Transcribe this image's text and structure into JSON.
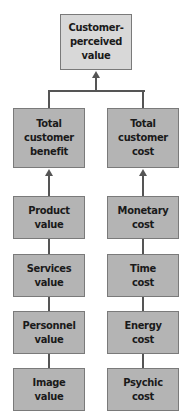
{
  "top": {
    "label": "Customer-\nperceived\nvalue"
  },
  "left_column": {
    "header": "Total\ncustomer\nbenefit",
    "items": [
      "Product\nvalue",
      "Services\nvalue",
      "Personnel\nvalue",
      "Image\nvalue"
    ]
  },
  "right_column": {
    "header": "Total\ncustomer\ncost",
    "items": [
      "Monetary\ncost",
      "Time\ncost",
      "Energy\ncost",
      "Psychic\ncost"
    ]
  },
  "colors": {
    "top_box": "#d8d8d8",
    "box": "#b4b4b4",
    "line": "#555555"
  }
}
